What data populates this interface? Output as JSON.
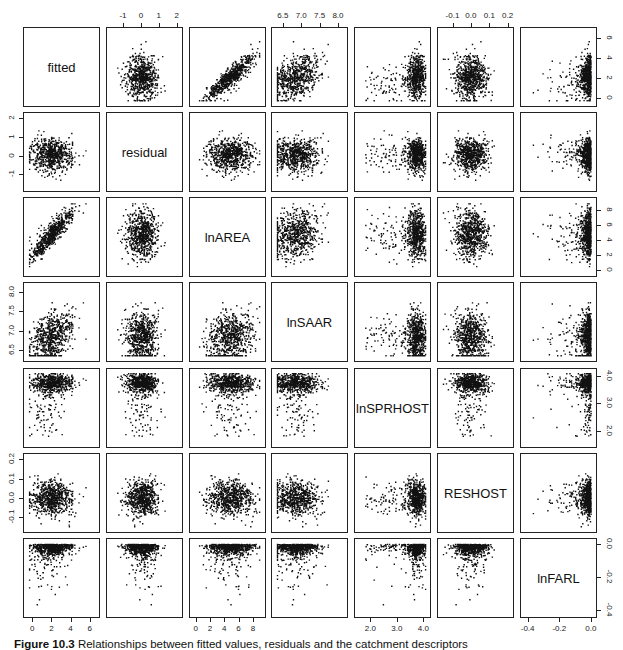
{
  "figure": {
    "caption_label": "Figure 10.3",
    "caption_text": "Relationships between fitted values, residuals and the catchment descriptors"
  },
  "chart_data": {
    "type": "scatter",
    "subtype": "scatterplot-matrix",
    "title": "",
    "variables": [
      "fitted",
      "residual",
      "lnAREA",
      "lnSAAR",
      "lnSPRHOST",
      "RESHOST",
      "lnFARL"
    ],
    "axes": {
      "fitted": {
        "range": [
          -0.5,
          6.6
        ],
        "ticks": [
          0,
          2,
          4,
          6
        ],
        "tick_labels": [
          "0",
          "2",
          "4",
          "6"
        ]
      },
      "residual": {
        "range": [
          -1.7,
          2.1
        ],
        "ticks": [
          -1,
          0,
          1,
          2
        ],
        "tick_labels": [
          "-1",
          "0",
          "1",
          "2"
        ]
      },
      "lnAREA": {
        "range": [
          -0.3,
          9.2
        ],
        "ticks": [
          0,
          2,
          4,
          6,
          8
        ],
        "tick_labels": [
          "0",
          "2",
          "4",
          "6",
          "8"
        ]
      },
      "lnSAAR": {
        "range": [
          6.3,
          8.15
        ],
        "ticks": [
          6.5,
          7.0,
          7.5,
          8.0
        ],
        "tick_labels": [
          "6.5",
          "7.0",
          "7.5",
          "8.0"
        ]
      },
      "lnSPRHOST": {
        "range": [
          1.55,
          4.12
        ],
        "ticks": [
          2.0,
          3.0,
          4.0
        ],
        "tick_labels": [
          "2.0",
          "3.0",
          "4.0"
        ]
      },
      "RESHOST": {
        "range": [
          -0.16,
          0.21
        ],
        "ticks": [
          -0.1,
          0.0,
          0.1,
          0.2
        ],
        "tick_labels": [
          "-0.1",
          "0.0",
          "0.1",
          "0.2"
        ]
      },
      "lnFARL": {
        "range": [
          -0.42,
          0.01
        ],
        "ticks": [
          -0.4,
          -0.2,
          0.0
        ],
        "tick_labels": [
          "-0.4",
          "-0.2",
          "0.0"
        ]
      }
    },
    "axis_placement": {
      "top": [
        "residual",
        "lnSAAR",
        "RESHOST"
      ],
      "bottom": [
        "fitted",
        "lnAREA",
        "lnSPRHOST",
        "lnFARL"
      ],
      "left": [
        "residual",
        "lnSAAR",
        "RESHOST"
      ],
      "right": [
        "fitted",
        "lnAREA",
        "lnSPRHOST",
        "lnFARL"
      ]
    },
    "n_points": 700,
    "correlations_observed": {
      "fitted~lnAREA": "strong positive",
      "fitted~lnSAAR": "moderate positive",
      "fitted~lnSPRHOST": "positive, left-skewed (most near 3.6-4.0)",
      "lnFARL": "concentrated near 0.0 with long negative tail",
      "residual": "centered at 0, roughly -1.5 to 2",
      "RESHOST": "centered near 0.0, range about -0.15 to 0.2"
    },
    "grid": false,
    "legend": null,
    "xlabel": "",
    "ylabel": ""
  }
}
